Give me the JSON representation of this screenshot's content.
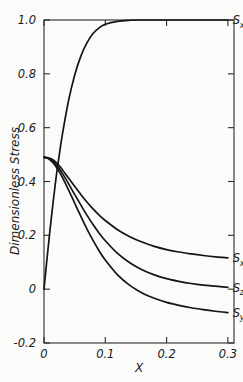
{
  "chart_data": {
    "type": "line",
    "title": "",
    "subtitle": "",
    "xlabel": "X",
    "ylabel": "Dimensionless Stress",
    "xlim": [
      0.0,
      0.31
    ],
    "ylim": [
      -0.2,
      1.0
    ],
    "grid": false,
    "legend_position": "inline-right-of-curve-ends",
    "x_ticks": [
      "0",
      "0.1",
      "0.2",
      "0.3"
    ],
    "x_tick_values": [
      0.0,
      0.1,
      0.2,
      0.3
    ],
    "y_ticks": [
      "1.0",
      "0.8",
      "0.6",
      "0.4",
      "0.2",
      "0",
      "-0.2"
    ],
    "y_tick_values": [
      1.0,
      0.8,
      0.6,
      0.4,
      0.2,
      0.0,
      -0.2
    ],
    "x": [
      0.0,
      0.005,
      0.01,
      0.015,
      0.02,
      0.025,
      0.03,
      0.04,
      0.05,
      0.06,
      0.07,
      0.08,
      0.09,
      0.1,
      0.12,
      0.14,
      0.16,
      0.18,
      0.2,
      0.22,
      0.24,
      0.26,
      0.28,
      0.3
    ],
    "series": [
      {
        "name": "S_xy",
        "label_main": "S",
        "label_sub": "xy",
        "values": [
          0.0,
          0.115,
          0.225,
          0.325,
          0.42,
          0.5,
          0.575,
          0.7,
          0.795,
          0.865,
          0.915,
          0.95,
          0.971,
          0.984,
          0.995,
          0.999,
          1.0,
          1.0,
          1.0,
          1.0,
          1.0,
          1.0,
          1.0,
          1.0
        ],
        "label_x": 0.3,
        "label_y": 1.0
      },
      {
        "name": "S_xx",
        "label_main": "S",
        "label_sub": "xx",
        "values": [
          0.49,
          0.489,
          0.486,
          0.48,
          0.47,
          0.458,
          0.444,
          0.413,
          0.382,
          0.352,
          0.324,
          0.298,
          0.275,
          0.255,
          0.221,
          0.195,
          0.175,
          0.159,
          0.147,
          0.138,
          0.131,
          0.125,
          0.12,
          0.116
        ],
        "label_x": 0.3,
        "label_y": 0.115
      },
      {
        "name": "S_zz",
        "label_main": "S",
        "label_sub": "zz",
        "values": [
          0.49,
          0.488,
          0.483,
          0.474,
          0.462,
          0.447,
          0.43,
          0.392,
          0.352,
          0.313,
          0.275,
          0.24,
          0.208,
          0.18,
          0.133,
          0.098,
          0.072,
          0.053,
          0.039,
          0.029,
          0.021,
          0.015,
          0.011,
          0.007
        ],
        "label_x": 0.3,
        "label_y": 0.005
      },
      {
        "name": "S_yy",
        "label_main": "S",
        "label_sub": "yy",
        "values": [
          0.49,
          0.487,
          0.48,
          0.469,
          0.454,
          0.436,
          0.415,
          0.369,
          0.32,
          0.271,
          0.224,
          0.181,
          0.142,
          0.108,
          0.053,
          0.014,
          -0.014,
          -0.034,
          -0.049,
          -0.06,
          -0.069,
          -0.076,
          -0.082,
          -0.087
        ],
        "label_x": 0.3,
        "label_y": -0.088
      }
    ]
  },
  "colors": {
    "curve": "#141414",
    "frame": "#2a2a2a",
    "text": "#1a1a1a",
    "background": "#fbfbf9"
  }
}
